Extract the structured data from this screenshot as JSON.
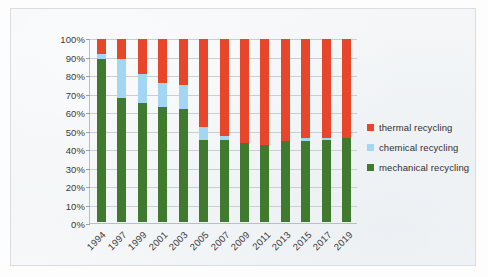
{
  "chart_data": {
    "type": "bar",
    "subtype": "100-percent-stacked-column",
    "title": "",
    "xlabel": "",
    "ylabel": "",
    "ylim": [
      0,
      100
    ],
    "ytick_labels": [
      "100%",
      "90%",
      "80%",
      "70%",
      "60%",
      "50%",
      "40%",
      "30%",
      "20%",
      "10%",
      "0%"
    ],
    "ytick_values": [
      100,
      90,
      80,
      70,
      60,
      50,
      40,
      30,
      20,
      10,
      0
    ],
    "grid": true,
    "legend_position": "right",
    "categories": [
      "1994",
      "1997",
      "1999",
      "2001",
      "2003",
      "2005",
      "2007",
      "2009",
      "2011",
      "2013",
      "2015",
      "2017",
      "2019"
    ],
    "series": [
      {
        "name": "mechanical recycling",
        "color": "#3f7a2e",
        "values": [
          89,
          68,
          65,
          63,
          62,
          45,
          45,
          43,
          42,
          44,
          44,
          45,
          46
        ]
      },
      {
        "name": "chemical recycling",
        "color": "#a2d6f2",
        "values": [
          3,
          21,
          16,
          13,
          13,
          7,
          2,
          0,
          0,
          0,
          2,
          1,
          0
        ]
      },
      {
        "name": "thermal recycling",
        "color": "#e8462a",
        "values": [
          8,
          11,
          19,
          24,
          25,
          48,
          53,
          57,
          58,
          56,
          54,
          54,
          54
        ]
      }
    ]
  },
  "legend": {
    "items": [
      {
        "label": "thermal recycling",
        "color": "#e8462a"
      },
      {
        "label": "chemical recycling",
        "color": "#a2d6f2"
      },
      {
        "label": "mechanical recycling",
        "color": "#3f7a2e"
      }
    ]
  }
}
